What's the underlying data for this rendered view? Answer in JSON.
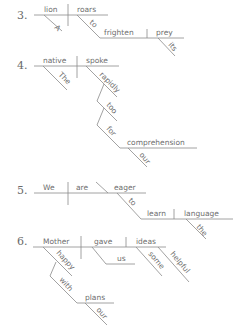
{
  "diagrams": [
    {
      "number": "3.",
      "words": {
        "subject": "lion",
        "subject_mod": "A",
        "verb": "roars",
        "infinitive_to": "to",
        "infinitive_verb": "frighten",
        "object": "prey",
        "object_mod": "its"
      }
    },
    {
      "number": "4.",
      "words": {
        "subject": "native",
        "subject_mod": "The",
        "verb": "spoke",
        "adverb": "rapidly",
        "adverb_mod": "too",
        "prep": "for",
        "prep_object": "comprehension",
        "prep_object_mod": "our"
      }
    },
    {
      "number": "5.",
      "words": {
        "subject": "We",
        "verb": "are",
        "predicate_adj": "eager",
        "infinitive_to": "to",
        "infinitive_verb": "learn",
        "object": "language",
        "object_mod": "the"
      }
    },
    {
      "number": "6.",
      "words": {
        "subject": "Mother",
        "subject_mod": "happy",
        "prep": "with",
        "prep_object": "plans",
        "prep_object_mod": "our",
        "verb": "gave",
        "indirect_object": "us",
        "object": "ideas",
        "object_mod1": "some",
        "object_mod2": "helpful"
      }
    }
  ],
  "colors": {
    "line": "#8a8a8a",
    "text": "#6e6e6e",
    "number": "#6a6a6a",
    "background": "#ffffff"
  }
}
